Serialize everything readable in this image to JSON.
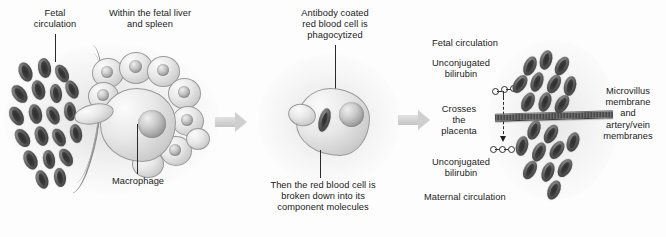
{
  "figure": {
    "type": "biological-process-diagram",
    "palette": {
      "background": "#fdfdfd",
      "rbc_dark": "#4e4e4e",
      "cell_light": "#e8e8e8",
      "membrane": "#585858",
      "arrow": "#cfcfcf",
      "text": "#1b1b1b"
    }
  },
  "panels": {
    "left": {
      "name": "fetal-liver-and-spleen-panel",
      "labels": {
        "fetal_circulation": "Fetal\ncirculation",
        "within_liver_spleen": "Within the fetal liver\nand spleen",
        "macrophage": "Macrophage"
      }
    },
    "middle": {
      "name": "phagocytosis-panel",
      "labels": {
        "antibody_coated": "Antibody coated\nred blood cell is\nphagocytized",
        "broken_down": "Then the red blood cell is\nbroken down into its\ncomponent molecules"
      }
    },
    "right": {
      "name": "placental-transfer-panel",
      "labels": {
        "fetal_circulation": "Fetal circulation",
        "unconjugated_bilirubin_top": "Unconjugated\nbilirubin",
        "crosses_the_placenta": "Crosses\nthe\nplacenta",
        "unconjugated_bilirubin_bottom": "Unconjugated\nbilirubin",
        "maternal_circulation": "Maternal circulation",
        "microvillus_membrane": "Microvillus\nmembrane\nand\nartery/vein\nmembranes"
      }
    }
  },
  "flow": {
    "arrow_1": "process-arrow-right",
    "arrow_2": "process-arrow-right"
  },
  "molecules": {
    "bilirubin_top": "unconjugated-bilirubin-molecule",
    "bilirubin_bottom": "unconjugated-bilirubin-molecule",
    "transfer_direction": "downward-across-membrane"
  }
}
